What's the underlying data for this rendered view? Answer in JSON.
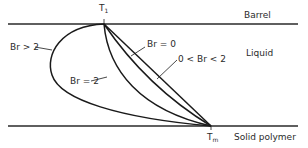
{
  "diagram": {
    "type": "temperature profile across melt film",
    "regions": {
      "top_boundary": "Barrel",
      "middle": "Liquid",
      "bottom_boundary": "Solid polymer"
    },
    "points": {
      "top": {
        "label": "T",
        "subscript": "1"
      },
      "bottom": {
        "label": "T",
        "subscript": "m"
      }
    },
    "curves": [
      {
        "id": "br-gt-2",
        "label": "Br > 2"
      },
      {
        "id": "br-eq-2",
        "label": "Br = 2"
      },
      {
        "id": "br-between",
        "label": "0 < Br < 2"
      },
      {
        "id": "br-eq-0",
        "label": "Br = 0"
      }
    ],
    "colors": {
      "line": "#1a1a1a",
      "background": "#ffffff"
    }
  }
}
